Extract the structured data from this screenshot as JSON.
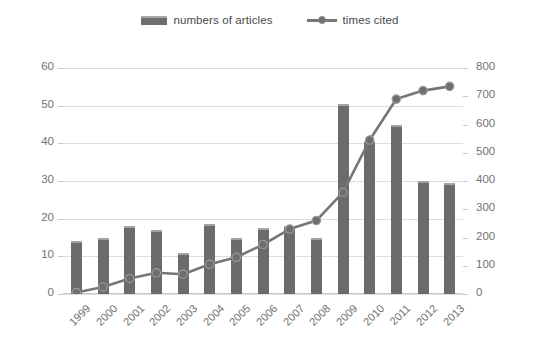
{
  "legend": {
    "items": [
      {
        "label": "numbers of articles",
        "marker": "bar-swatch-icon",
        "color": "#6b6b6b"
      },
      {
        "label": "times cited",
        "marker": "line-marker-icon",
        "color": "#767676"
      }
    ]
  },
  "axes": {
    "left": {
      "ticks": [
        0,
        10,
        20,
        30,
        40,
        50,
        60
      ],
      "min": 0,
      "max": 60
    },
    "right": {
      "ticks": [
        0,
        100,
        200,
        300,
        400,
        500,
        600,
        700,
        800
      ],
      "min": 0,
      "max": 800
    },
    "x": {
      "categories": [
        "1999",
        "2000",
        "2001",
        "2002",
        "2003",
        "2004",
        "2005",
        "2006",
        "2007",
        "2008",
        "2009",
        "2010",
        "2011",
        "2012",
        "2013"
      ]
    }
  },
  "chart_data": {
    "type": "bar",
    "title": "",
    "subtitle": "",
    "xlabel": "",
    "ylabel": "",
    "y2label": "",
    "categories": [
      "1999",
      "2000",
      "2001",
      "2002",
      "2003",
      "2004",
      "2005",
      "2006",
      "2007",
      "2008",
      "2009",
      "2010",
      "2011",
      "2012",
      "2013"
    ],
    "series": [
      {
        "name": "numbers of articles",
        "type": "bar",
        "axis": "left",
        "color": "#6b6b6b",
        "values": [
          14,
          15,
          18,
          17,
          11,
          18.5,
          15,
          17.5,
          18,
          15,
          50.5,
          40.5,
          45,
          30,
          29.5
        ]
      },
      {
        "name": "times cited",
        "type": "line",
        "axis": "right",
        "color": "#767676",
        "values": [
          5,
          25,
          55,
          75,
          70,
          105,
          130,
          175,
          230,
          260,
          360,
          545,
          690,
          720,
          735
        ]
      }
    ],
    "ylim": [
      0,
      60
    ],
    "y2lim": [
      0,
      800
    ],
    "grid": true,
    "legend_position": "top-center"
  }
}
